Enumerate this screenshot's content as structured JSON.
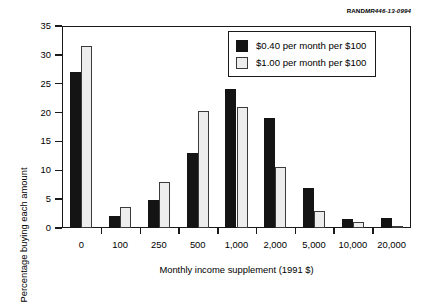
{
  "source_credit": {
    "mark": "RAND",
    "id": "MR446-13-0994"
  },
  "chart_data": {
    "type": "bar",
    "title": "",
    "xlabel": "Monthly income supplement (1991 $)",
    "ylabel": "Percentage buying each amount",
    "categories": [
      "0",
      "100",
      "250",
      "500",
      "1,000",
      "2,000",
      "5,000",
      "10,000",
      "20,000"
    ],
    "series": [
      {
        "name": "$0.40 per month per $100",
        "color": "#141414",
        "values": [
          27.0,
          2.0,
          4.8,
          13.0,
          24.0,
          19.0,
          7.0,
          1.5,
          1.8
        ]
      },
      {
        "name": "$1.00 per month per $100",
        "color": "#ededed",
        "values": [
          31.5,
          3.7,
          8.0,
          20.3,
          21.0,
          10.5,
          3.0,
          1.0,
          0.4
        ]
      }
    ],
    "ylim": [
      0,
      35
    ],
    "yticks": [
      0,
      5,
      10,
      15,
      20,
      25,
      30,
      35
    ],
    "ytick_labels": [
      "0",
      "5",
      "10",
      "15",
      "20",
      "25",
      "30",
      "35"
    ],
    "grid": false,
    "legend_position": "top-right"
  }
}
